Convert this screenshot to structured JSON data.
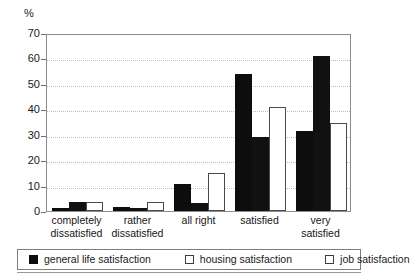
{
  "chart_data": {
    "type": "bar",
    "title": "",
    "xlabel": "",
    "ylabel": "%",
    "ylim": [
      0,
      70
    ],
    "yticks": [
      0,
      10,
      20,
      30,
      40,
      50,
      60,
      70
    ],
    "grid": true,
    "legend_position": "bottom",
    "categories": [
      "completely dissatisfied",
      "rather dissatisfied",
      "all right",
      "satisfied",
      "very satisfied"
    ],
    "category_lines": [
      [
        "completely",
        "dissatisfied"
      ],
      [
        "rather",
        "dissatisfied"
      ],
      [
        "all right",
        ""
      ],
      [
        "satisfied",
        ""
      ],
      [
        "very",
        "satisfied"
      ]
    ],
    "series": [
      {
        "name": "general life satisfaction",
        "swatch": "filled",
        "color": "#0d0d0d",
        "values": [
          1,
          1.5,
          10.5,
          54,
          31.5
        ]
      },
      {
        "name": "housing satisfaction",
        "swatch": "open",
        "color": "#111111",
        "values": [
          3.5,
          1,
          3,
          29,
          61
        ]
      },
      {
        "name": "job satisfaction",
        "swatch": "open",
        "color": "#ffffff",
        "values": [
          3.5,
          3.5,
          15,
          41,
          34.5
        ]
      }
    ]
  },
  "axis": {
    "unit_label": "%"
  },
  "legend": {
    "items": [
      {
        "label": "general life satisfaction"
      },
      {
        "label": "housing satisfaction"
      },
      {
        "label": "job satisfaction"
      }
    ]
  }
}
